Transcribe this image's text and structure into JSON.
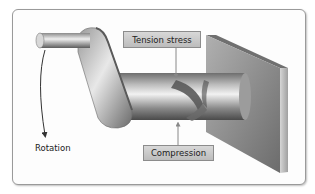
{
  "diagram": {
    "labels": {
      "tension": "Tension stress",
      "compression": "Compression",
      "rotation": "Rotation"
    },
    "components": [
      "crank-handle",
      "crank-arm",
      "shaft",
      "wall-block",
      "helical-stress-band"
    ],
    "colors": {
      "metal_light": "#e6e6e6",
      "metal_mid": "#a8a8a8",
      "metal_dark": "#5a5a5a",
      "label_bg": "#c8c8c8",
      "panel_border": "#9a9a9a"
    }
  }
}
